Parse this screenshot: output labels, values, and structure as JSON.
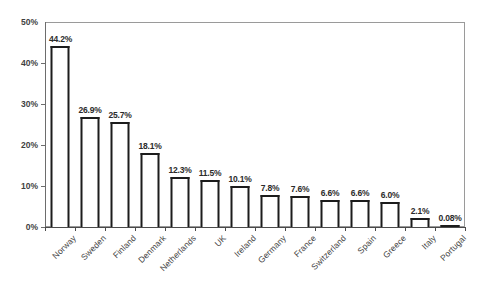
{
  "chart_data": {
    "type": "bar",
    "title": "",
    "subtitle": "",
    "xlabel": "",
    "ylabel": "",
    "ylim": [
      0,
      50
    ],
    "y_tick_labels": [
      "0%",
      "10%",
      "20%",
      "30%",
      "40%",
      "50%"
    ],
    "y_ticks": [
      0,
      10,
      20,
      30,
      40,
      50
    ],
    "grid": false,
    "legend": null,
    "legend_position": "none",
    "value_suffix": "%",
    "categories": [
      "Norway",
      "Sweden",
      "Finland",
      "Denmark",
      "Netherlands",
      "UK",
      "Ireland",
      "Germany",
      "France",
      "Switzerland",
      "Spain",
      "Greece",
      "Italy",
      "Portugal"
    ],
    "values": [
      44.2,
      26.9,
      25.7,
      18.1,
      12.3,
      11.5,
      10.1,
      7.8,
      7.6,
      6.6,
      6.6,
      6.0,
      2.1,
      0.08
    ],
    "data_labels": [
      "44.2%",
      "26.9%",
      "25.7%",
      "18.1%",
      "12.3%",
      "11.5%",
      "10.1%",
      "7.8%",
      "7.6%",
      "6.6%",
      "6.6%",
      "6.0%",
      "2.1%",
      "0.08%"
    ],
    "bar_style": {
      "fill": "#ffffff",
      "edge": "#1c1c1c",
      "edge_width": 2
    },
    "frame_color": "#9a9a9a",
    "axis_color": "#4a4a4a",
    "label_color": "#3f3f3f",
    "background": "#ffffff"
  }
}
